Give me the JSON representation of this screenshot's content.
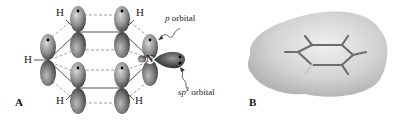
{
  "figure": {
    "panel_a": {
      "label": "A",
      "atoms": {
        "h_top_left": "H",
        "h_top_right": "H",
        "h_left": "H",
        "h_bottom_left": "H",
        "h_bottom_right": "H",
        "nitrogen": "N"
      },
      "annotations": {
        "p_orbital_italic": "p",
        "p_orbital_text": " orbital",
        "sp2_italic": "sp",
        "sp2_sup": "2",
        "sp2_text": " orbital"
      }
    },
    "panel_b": {
      "label": "B"
    },
    "colors": {
      "orbital_dark": "#3a3a3a",
      "orbital_light": "#bdbdbd",
      "surface": "#d6d6d6",
      "bond_line": "#555555"
    }
  }
}
